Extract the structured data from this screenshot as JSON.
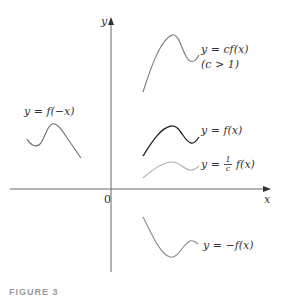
{
  "figure": {
    "caption": "FIGURE 3",
    "axes": {
      "x_label": "x",
      "y_label": "y",
      "origin_label": "0"
    },
    "curves": [
      {
        "id": "cf",
        "label_line1": "y = cf(x)",
        "label_line2": "(c > 1)",
        "color": "#7a7a7a"
      },
      {
        "id": "f",
        "label": "y = f(x)",
        "color": "#222222"
      },
      {
        "id": "inv_c_f",
        "label_prefix": "y =",
        "frac_num": "1",
        "frac_den": "c",
        "label_suffix": "f(x)",
        "color": "#b0b0b0"
      },
      {
        "id": "neg_f",
        "label": "y = −f(x)",
        "color": "#8a8a8a"
      },
      {
        "id": "f_neg_x",
        "label": "y = f(−x)",
        "color": "#6e6e6e"
      }
    ],
    "colors": {
      "axis": "#555555",
      "text": "#333333",
      "background": "#ffffff"
    }
  }
}
